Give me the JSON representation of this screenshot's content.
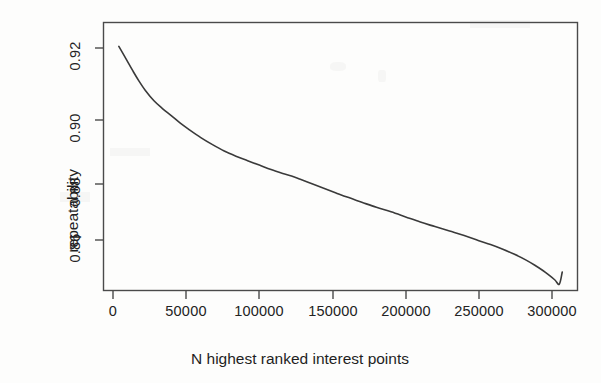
{
  "figure": {
    "kind": "scanned-line-plot",
    "ink_color": "#3a3a3a",
    "frame_color": "#4a4a4a",
    "paper_color": "#fdfdfc"
  },
  "chart_data": {
    "type": "line",
    "title": "",
    "subtitle": "",
    "xlabel": "N highest ranked interest points",
    "ylabel": "repeatability",
    "xlim": [
      -6000,
      318000
    ],
    "ylim": [
      0.8475,
      0.9285
    ],
    "grid": false,
    "legend": null,
    "xticks": [
      0,
      50000,
      100000,
      150000,
      200000,
      250000,
      300000
    ],
    "xtick_labels": [
      "0",
      "50000",
      "100000",
      "150000",
      "200000",
      "250000",
      "300000"
    ],
    "yticks": [
      0.86,
      0.88,
      0.9,
      0.92
    ],
    "ytick_labels": [
      "0.86",
      "0.88",
      "0.90",
      "0.92"
    ],
    "series": [
      {
        "name": "repeatability vs N",
        "x": [
          4000,
          9000,
          14000,
          18000,
          22000,
          28000,
          34000,
          40000,
          46000,
          52000,
          60000,
          68000,
          76000,
          84000,
          92000,
          100000,
          108000,
          116000,
          122000,
          128000,
          136000,
          144000,
          152000,
          160000,
          170000,
          180000,
          190000,
          200000,
          210000,
          220000,
          230000,
          240000,
          250000,
          258000,
          266000,
          274000,
          282000,
          288000,
          294000,
          298000,
          302000,
          305000,
          307000
        ],
        "y": [
          0.9205,
          0.9165,
          0.9125,
          0.9095,
          0.9068,
          0.9035,
          0.901,
          0.8988,
          0.8965,
          0.8945,
          0.892,
          0.8898,
          0.8878,
          0.8862,
          0.8848,
          0.8834,
          0.882,
          0.8808,
          0.88,
          0.879,
          0.8776,
          0.8762,
          0.8748,
          0.8734,
          0.8718,
          0.8702,
          0.8688,
          0.8672,
          0.8656,
          0.8642,
          0.8628,
          0.8614,
          0.8598,
          0.8586,
          0.8572,
          0.8556,
          0.8538,
          0.8522,
          0.8504,
          0.849,
          0.8475,
          0.8462,
          0.85
        ]
      }
    ]
  }
}
